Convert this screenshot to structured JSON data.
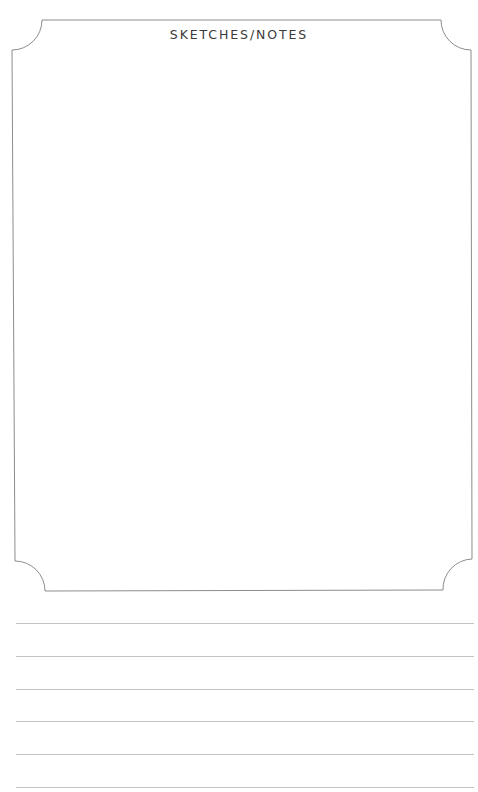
{
  "page": {
    "title": "SKETCHES/NOTES",
    "colors": {
      "frame_stroke": "#8c8c8c",
      "ruled_line": "#c4c4c4",
      "title_text": "#3a3a3a",
      "background": "#ffffff"
    }
  },
  "notes_area": {
    "ruled_lines": [
      {
        "y": 623
      },
      {
        "y": 656
      },
      {
        "y": 689
      },
      {
        "y": 721
      },
      {
        "y": 754
      },
      {
        "y": 787
      }
    ]
  }
}
